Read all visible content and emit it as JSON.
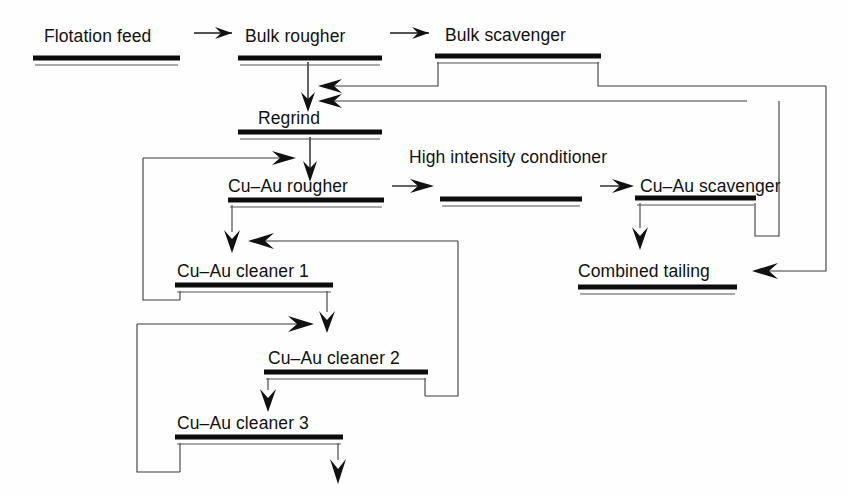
{
  "diagram": {
    "type": "process-flowsheet",
    "units": [
      {
        "id": "flotation-feed",
        "label": "Flotation feed",
        "x": 33,
        "y": 58,
        "width": 147,
        "label_x": 44,
        "label_y": 42,
        "has_bar": true
      },
      {
        "id": "bulk-rougher",
        "label": "Bulk rougher",
        "x": 238,
        "y": 58,
        "width": 144,
        "label_x": 245,
        "label_y": 42,
        "has_bar": true
      },
      {
        "id": "bulk-scavenger",
        "label": "Bulk scavenger",
        "x": 435,
        "y": 56,
        "width": 166,
        "label_x": 445,
        "label_y": 41,
        "has_bar": true
      },
      {
        "id": "regrind",
        "label": "Regrind",
        "x": 238,
        "y": 132,
        "width": 144,
        "label_x": 258,
        "label_y": 124,
        "has_bar": true
      },
      {
        "id": "cu-au-rougher",
        "label": "Cu–Au rougher",
        "x": 228,
        "y": 200,
        "width": 156,
        "label_x": 228,
        "label_y": 192,
        "has_bar": true
      },
      {
        "id": "high-intensity-conditioner",
        "label": "High intensity conditioner",
        "x": 440,
        "y": 199,
        "width": 142,
        "label_x": 409,
        "label_y": 163,
        "has_bar": true
      },
      {
        "id": "cu-au-scavenger",
        "label": "Cu–Au scavenger",
        "x": 635,
        "y": 198,
        "width": 121,
        "label_x": 640,
        "label_y": 192,
        "has_bar": true
      },
      {
        "id": "cu-au-cleaner-1",
        "label": "Cu–Au cleaner 1",
        "x": 175,
        "y": 285,
        "width": 158,
        "label_x": 177,
        "label_y": 277,
        "has_bar": true
      },
      {
        "id": "combined-tailing",
        "label": "Combined tailing",
        "x": 578,
        "y": 287,
        "width": 159,
        "label_x": 578,
        "label_y": 277,
        "has_bar": true
      },
      {
        "id": "cu-au-cleaner-2",
        "label": "Cu–Au cleaner 2",
        "x": 264,
        "y": 372,
        "width": 164,
        "label_x": 268,
        "label_y": 364,
        "has_bar": true
      },
      {
        "id": "cu-au-cleaner-3",
        "label": "Cu–Au cleaner 3",
        "x": 175,
        "y": 437,
        "width": 168,
        "label_x": 177,
        "label_y": 429,
        "has_bar": true
      }
    ],
    "colors": {
      "ink": "#111111",
      "line": "#1a1a1a",
      "thin_line": "#555555",
      "background": "#ffffff"
    },
    "connections": [
      {
        "id": "feed-to-bulk-rougher",
        "from": "flotation-feed",
        "to": "bulk-rougher"
      },
      {
        "id": "bulk-rougher-to-bulk-scavenger",
        "from": "bulk-rougher",
        "to": "bulk-scavenger"
      },
      {
        "id": "bulk-rougher-conc-to-regrind",
        "from": "bulk-rougher",
        "to": "regrind"
      },
      {
        "id": "bulk-scavenger-conc-to-regrind",
        "from": "bulk-scavenger",
        "to": "regrind"
      },
      {
        "id": "bulk-scavenger-tail-to-combined",
        "from": "bulk-scavenger",
        "to": "combined-tailing"
      },
      {
        "id": "regrind-to-cu-au-rougher",
        "from": "regrind",
        "to": "cu-au-rougher"
      },
      {
        "id": "cleaner1-tail-recycle-to-rougher",
        "from": "cu-au-cleaner-1",
        "to": "cu-au-rougher"
      },
      {
        "id": "rougher-tail-to-conditioner",
        "from": "cu-au-rougher",
        "to": "high-intensity-conditioner"
      },
      {
        "id": "conditioner-to-cu-au-scavenger",
        "from": "high-intensity-conditioner",
        "to": "cu-au-scavenger"
      },
      {
        "id": "cu-au-scavenger-tail-to-combined",
        "from": "cu-au-scavenger",
        "to": "combined-tailing"
      },
      {
        "id": "cu-au-scavenger-conc-recycle-regrind",
        "from": "cu-au-scavenger",
        "to": "regrind"
      },
      {
        "id": "rougher-conc-to-cleaner-1",
        "from": "cu-au-rougher",
        "to": "cu-au-cleaner-1"
      },
      {
        "id": "cleaner2-tail-to-cleaner-1",
        "from": "cu-au-cleaner-2",
        "to": "cu-au-cleaner-1"
      },
      {
        "id": "cleaner1-conc-to-cleaner-2",
        "from": "cu-au-cleaner-1",
        "to": "cu-au-cleaner-2"
      },
      {
        "id": "cleaner3-tail-to-cleaner-2",
        "from": "cu-au-cleaner-3",
        "to": "cu-au-cleaner-2"
      },
      {
        "id": "cleaner2-conc-to-cleaner-3",
        "from": "cu-au-cleaner-2",
        "to": "cu-au-cleaner-3"
      },
      {
        "id": "cleaner3-conc-final-product",
        "from": "cu-au-cleaner-3",
        "to": "final-concentrate"
      }
    ]
  }
}
